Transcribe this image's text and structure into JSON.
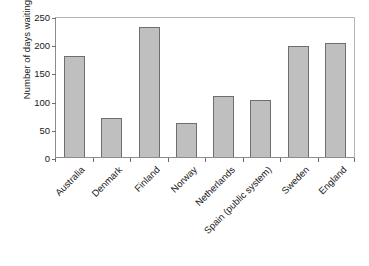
{
  "chart_data": {
    "type": "bar",
    "title": "",
    "xlabel": "",
    "ylabel": "Number of days waiting",
    "ylim": [
      0,
      250
    ],
    "yticks": [
      0,
      50,
      100,
      150,
      200,
      250
    ],
    "grid": false,
    "legend": false,
    "bar_color": "#bfbfbf",
    "bar_edge_color": "#6e6e6e",
    "categories": [
      "Australia",
      "Denmark",
      "Finland",
      "Norway",
      "Netherlands",
      "Spain (public system)",
      "Sweden",
      "England"
    ],
    "values": [
      179,
      70,
      231,
      61,
      109,
      101,
      196,
      203
    ]
  }
}
